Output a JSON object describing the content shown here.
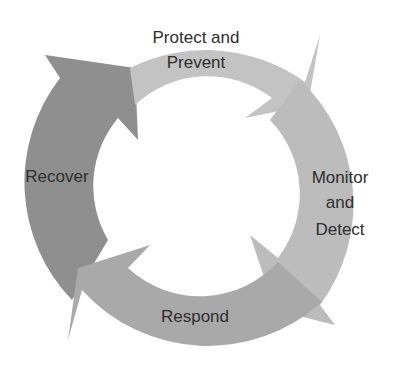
{
  "diagram": {
    "type": "cycle",
    "center": [
      196,
      190
    ],
    "outer_radius": 170,
    "inner_radius": 106,
    "segments": [
      {
        "id": "protect",
        "lines": [
          "Protect and",
          "Prevent"
        ],
        "color": "#c3c3c3"
      },
      {
        "id": "monitor",
        "lines": [
          "Monitor",
          "and",
          "Detect"
        ],
        "color": "#bcbcbc"
      },
      {
        "id": "respond",
        "lines": [
          "Respond"
        ],
        "color": "#a9a9a9"
      },
      {
        "id": "recover",
        "lines": [
          "Recover"
        ],
        "color": "#8f8f8f"
      }
    ]
  }
}
